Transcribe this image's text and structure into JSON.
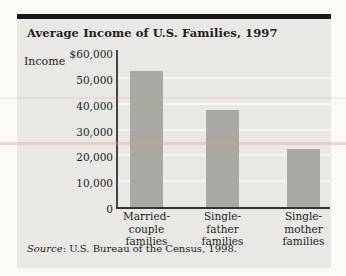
{
  "chart_data": {
    "type": "bar",
    "title": "Average Income of U.S. Families, 1997",
    "ylabel": "Income",
    "categories": [
      [
        "Married-",
        "couple",
        "families"
      ],
      [
        "Single-",
        "father",
        "families"
      ],
      [
        "Single-",
        "mother",
        "families"
      ]
    ],
    "values": [
      52500,
      37500,
      22500
    ],
    "ylim": [
      0,
      60000
    ],
    "ytick_labels": [
      "$60,000",
      "50,000",
      "40,000",
      "30,000",
      "20,000",
      "10,000",
      "0"
    ],
    "grid": true,
    "legend_position": "none",
    "source": "Source: U.S. Bureau of the Census, 1998.",
    "colors": {
      "bar": "#a7a9a2",
      "panel_bg": "#e9e8e4",
      "top_rule": "#181715",
      "axis": "#35342f",
      "gridline": "#f7f6f2",
      "text": "#201f1c",
      "page_bg": "#fbfaf7"
    }
  },
  "source_note": {
    "label": "Source",
    "rest": ": U.S. Bureau of the Census, 1998."
  }
}
